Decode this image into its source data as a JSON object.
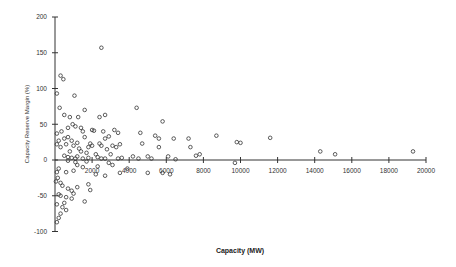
{
  "chart_data": {
    "type": "scatter",
    "title": "",
    "xlabel": "Capacity (MW)",
    "ylabel": "Capacity Reserve Margin (%)",
    "xlim": [
      0,
      20000
    ],
    "ylim": [
      -100,
      200
    ],
    "x_ticks": [
      2000,
      4000,
      6000,
      8000,
      10000,
      12000,
      14000,
      16000,
      18000,
      20000
    ],
    "y_ticks": [
      -100,
      -50,
      0,
      50,
      100,
      150,
      200
    ],
    "grid": false,
    "legend": null,
    "marker": "open-circle",
    "series": [
      {
        "name": "plants",
        "points": [
          [
            2500,
            157
          ],
          [
            300,
            118
          ],
          [
            450,
            113
          ],
          [
            100,
            93
          ],
          [
            1050,
            90
          ],
          [
            250,
            73
          ],
          [
            4400,
            73
          ],
          [
            1600,
            70
          ],
          [
            2400,
            60
          ],
          [
            5800,
            54
          ],
          [
            500,
            63
          ],
          [
            2700,
            63
          ],
          [
            1250,
            60
          ],
          [
            800,
            60
          ],
          [
            950,
            50
          ],
          [
            1100,
            47
          ],
          [
            1400,
            45
          ],
          [
            700,
            45
          ],
          [
            2600,
            40
          ],
          [
            1500,
            40
          ],
          [
            3400,
            38
          ],
          [
            100,
            37
          ],
          [
            350,
            40
          ],
          [
            2000,
            42
          ],
          [
            2100,
            41
          ],
          [
            3200,
            42
          ],
          [
            4600,
            38
          ],
          [
            5400,
            34
          ],
          [
            7200,
            30
          ],
          [
            8700,
            34
          ],
          [
            9800,
            25
          ],
          [
            10000,
            24
          ],
          [
            11600,
            31
          ],
          [
            2900,
            33
          ],
          [
            1600,
            32
          ],
          [
            2700,
            30
          ],
          [
            5600,
            30
          ],
          [
            6400,
            30
          ],
          [
            500,
            30
          ],
          [
            700,
            32
          ],
          [
            900,
            27
          ],
          [
            1200,
            24
          ],
          [
            1900,
            23
          ],
          [
            2000,
            20
          ],
          [
            2400,
            23
          ],
          [
            2500,
            20
          ],
          [
            3100,
            20
          ],
          [
            3300,
            18
          ],
          [
            3500,
            22
          ],
          [
            4700,
            23
          ],
          [
            5600,
            18
          ],
          [
            7300,
            18
          ],
          [
            600,
            22
          ],
          [
            1800,
            18
          ],
          [
            2800,
            15
          ],
          [
            1000,
            20
          ],
          [
            300,
            18
          ],
          [
            200,
            27
          ],
          [
            100,
            22
          ],
          [
            1300,
            16
          ],
          [
            1400,
            12
          ],
          [
            800,
            12
          ],
          [
            1700,
            10
          ],
          [
            2200,
            8
          ],
          [
            3000,
            8
          ],
          [
            4200,
            5
          ],
          [
            5000,
            5
          ],
          [
            6100,
            5
          ],
          [
            7600,
            6
          ],
          [
            7800,
            8
          ],
          [
            500,
            6
          ],
          [
            700,
            4
          ],
          [
            900,
            3
          ],
          [
            1100,
            2
          ],
          [
            1200,
            5
          ],
          [
            1500,
            2
          ],
          [
            1800,
            3
          ],
          [
            2300,
            4
          ],
          [
            2500,
            2
          ],
          [
            2700,
            2
          ],
          [
            3400,
            2
          ],
          [
            3600,
            3
          ],
          [
            4500,
            2
          ],
          [
            5200,
            2
          ],
          [
            6500,
            1
          ],
          [
            9700,
            -4
          ],
          [
            14300,
            12
          ],
          [
            15100,
            8
          ],
          [
            19300,
            12
          ],
          [
            1700,
            -2
          ],
          [
            1100,
            -3
          ],
          [
            700,
            -1
          ],
          [
            1200,
            -7
          ],
          [
            2300,
            -9
          ],
          [
            2900,
            -4
          ],
          [
            3100,
            -7
          ],
          [
            3500,
            -18
          ],
          [
            3900,
            -12
          ],
          [
            5800,
            -18
          ],
          [
            6200,
            -20
          ],
          [
            5000,
            -18
          ],
          [
            2200,
            -20
          ],
          [
            2700,
            -22
          ],
          [
            200,
            -12
          ],
          [
            100,
            -17
          ],
          [
            600,
            -17
          ],
          [
            300,
            -32
          ],
          [
            400,
            -36
          ],
          [
            700,
            -40
          ],
          [
            900,
            -43
          ],
          [
            1000,
            -47
          ],
          [
            600,
            -52
          ],
          [
            300,
            -50
          ],
          [
            200,
            -48
          ],
          [
            1600,
            -58
          ],
          [
            900,
            -54
          ],
          [
            500,
            -60
          ],
          [
            100,
            -62
          ],
          [
            400,
            -66
          ],
          [
            600,
            -70
          ],
          [
            300,
            -75
          ],
          [
            200,
            -81
          ],
          [
            100,
            -87
          ],
          [
            1200,
            -38
          ],
          [
            1800,
            -34
          ],
          [
            1900,
            -42
          ],
          [
            1000,
            -15
          ],
          [
            1500,
            -10
          ],
          [
            150,
            -25
          ],
          [
            50,
            -30
          ]
        ]
      }
    ]
  }
}
